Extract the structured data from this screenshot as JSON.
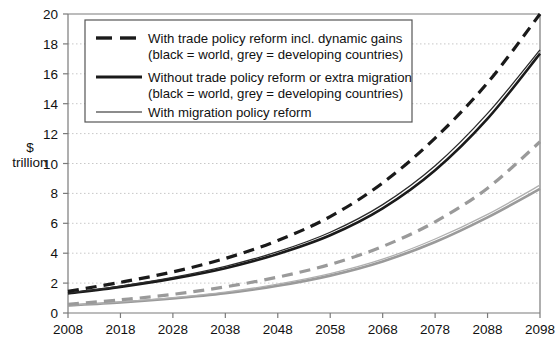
{
  "chart_data": {
    "type": "line",
    "title": "",
    "subtitle": "",
    "xlabel": "",
    "ylabel": "$\ntrillion",
    "ylabel_line1": "$",
    "ylabel_line2": "trillion",
    "x": [
      2008,
      2018,
      2028,
      2038,
      2048,
      2058,
      2068,
      2078,
      2088,
      2098
    ],
    "xlim": [
      2008,
      2098
    ],
    "ylim": [
      0,
      20
    ],
    "xticks": [
      "2008",
      "2018",
      "2028",
      "2038",
      "2048",
      "2058",
      "2068",
      "2078",
      "2088",
      "2098"
    ],
    "yticks": [
      "0",
      "2",
      "4",
      "6",
      "8",
      "10",
      "12",
      "14",
      "16",
      "18",
      "20"
    ],
    "grid": "horizontal-dotted",
    "legend_position": "top-left-inside",
    "series": [
      {
        "name": "With trade policy reform incl. dynamic gains — world",
        "group": "With trade policy reform incl. dynamic gains",
        "region": "world",
        "style": "dashed",
        "color": "#1a1a1a",
        "width": 3.2,
        "values": [
          1.45,
          2.05,
          2.75,
          3.65,
          4.85,
          6.45,
          8.7,
          11.7,
          15.4,
          20.0
        ]
      },
      {
        "name": "Without trade policy reform or extra migration — world",
        "group": "Without trade policy reform or extra migration",
        "region": "world",
        "style": "solid",
        "color": "#1a1a1a",
        "width": 2.6,
        "values": [
          1.3,
          1.75,
          2.3,
          3.0,
          3.95,
          5.2,
          7.0,
          9.55,
          13.0,
          17.35
        ]
      },
      {
        "name": "With migration policy reform — world",
        "group": "With migration policy reform",
        "region": "world",
        "style": "solid-thin",
        "color": "#2b2b2b",
        "width": 1.3,
        "values": [
          1.33,
          1.8,
          2.38,
          3.12,
          4.1,
          5.4,
          7.25,
          9.85,
          13.35,
          17.6
        ]
      },
      {
        "name": "With trade policy reform incl. dynamic gains — developing countries",
        "group": "With trade policy reform incl. dynamic gains",
        "region": "developing countries",
        "style": "dashed",
        "color": "#9a9a9a",
        "width": 3.2,
        "values": [
          0.58,
          0.88,
          1.25,
          1.75,
          2.4,
          3.25,
          4.45,
          6.1,
          8.35,
          11.45
        ]
      },
      {
        "name": "Without trade policy reform or extra migration — developing countries",
        "group": "Without trade policy reform or extra migration",
        "region": "developing countries",
        "style": "solid",
        "color": "#9a9a9a",
        "width": 2.6,
        "values": [
          0.5,
          0.7,
          0.97,
          1.32,
          1.82,
          2.5,
          3.45,
          4.75,
          6.4,
          8.3
        ]
      },
      {
        "name": "With migration policy reform — developing countries",
        "group": "With migration policy reform",
        "region": "developing countries",
        "style": "solid-thin",
        "color": "#b0b0b0",
        "width": 1.3,
        "values": [
          0.52,
          0.74,
          1.03,
          1.4,
          1.93,
          2.63,
          3.6,
          4.95,
          6.6,
          8.55
        ]
      }
    ],
    "legend": [
      {
        "line1": "With trade policy reform incl. dynamic gains",
        "line2": "(black = world, grey = developing countries)",
        "style": "dashed"
      },
      {
        "line1": "Without trade policy reform or extra migration",
        "line2": "(black = world, grey = developing countries)",
        "style": "solid"
      },
      {
        "line1": "With migration policy reform",
        "line2": "",
        "style": "solid-thin"
      }
    ],
    "colors": {
      "black": "#1a1a1a",
      "grey": "#9a9a9a",
      "axis": "#7a7a7a",
      "grid": "#c8c8c8",
      "background": "#ffffff"
    }
  }
}
